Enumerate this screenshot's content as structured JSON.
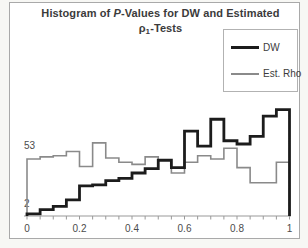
{
  "figure": {
    "title": {
      "line1_prefix": "Histogram of ",
      "line1_italic": "P",
      "line1_rest": "-Values for DW and Estimated",
      "line2_symbol": "ρ",
      "line2_subscript": "1",
      "line2_rest": "-Tests"
    }
  },
  "legend": {
    "items": [
      {
        "label": "DW",
        "color": "#1c1c1c",
        "thickness": 3
      },
      {
        "label": "Est. Rho",
        "color": "#8a8a8a",
        "thickness": 2
      }
    ]
  },
  "chart_data": {
    "type": "line",
    "style": "step-histogram-outline",
    "title": "Histogram of P-Values for DW and Estimated ρ1-Tests",
    "xlabel": "",
    "ylabel": "",
    "xlim": [
      0,
      1
    ],
    "ylim": [
      0,
      110
    ],
    "grid": false,
    "legend_position": "top-right",
    "bin_width": 0.05,
    "bin_edges": [
      0,
      0.05,
      0.1,
      0.15,
      0.2,
      0.25,
      0.3,
      0.35,
      0.4,
      0.45,
      0.5,
      0.55,
      0.6,
      0.65,
      0.7,
      0.75,
      0.8,
      0.85,
      0.9,
      0.95,
      1.0
    ],
    "series": [
      {
        "name": "Est. Rho",
        "color": "#8a8a8a",
        "values": [
          53,
          55,
          56,
          60,
          46,
          68,
          54,
          50,
          48,
          55,
          51,
          40,
          50,
          56,
          53,
          63,
          45,
          31,
          31,
          50
        ]
      },
      {
        "name": "DW",
        "color": "#1c1c1c",
        "values": [
          2,
          6,
          9,
          15,
          28,
          29,
          33,
          35,
          40,
          44,
          52,
          45,
          79,
          65,
          90,
          70,
          67,
          74,
          93,
          99
        ]
      }
    ],
    "x_ticks": [
      0,
      0.2,
      0.4,
      0.6,
      0.8,
      1
    ],
    "x_tick_labels": [
      "0",
      "0.2",
      "0.4",
      "0.6",
      "0.8",
      "1"
    ],
    "minor_tick_step": 0.05,
    "annotations": [
      {
        "text": "53",
        "x": 0.0,
        "y": 62,
        "meaning": "first-bin count of Est. Rho"
      },
      {
        "text": "2",
        "x": 0.0,
        "y": 8,
        "meaning": "first-bin count of DW"
      }
    ]
  }
}
